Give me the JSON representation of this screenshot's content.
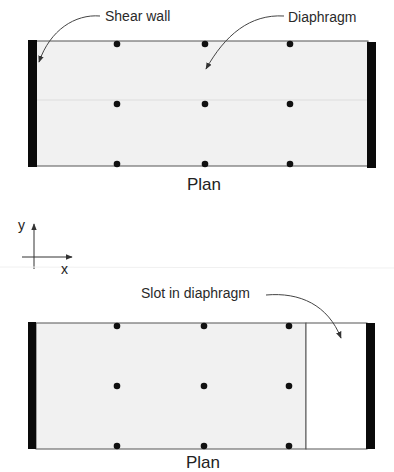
{
  "figure": {
    "top_plan": {
      "caption": "Plan",
      "labels": {
        "shear_wall": "Shear wall",
        "diaphragm": "Diaphragm"
      },
      "columns_grid": {
        "x": [
          117,
          205,
          290
        ],
        "y": [
          44,
          104,
          164
        ]
      }
    },
    "axes": {
      "x_label": "x",
      "y_label": "y"
    },
    "bottom_plan": {
      "caption": "Plan",
      "labels": {
        "slot": "Slot in diaphragm"
      },
      "columns_grid": {
        "x": [
          117,
          204,
          289
        ],
        "y": [
          326,
          386,
          446
        ]
      }
    },
    "colors": {
      "diaphragm_fill": "#f1f1f1",
      "wall": "#0a0a0a",
      "outline": "#444444",
      "slot_fill": "#ffffff"
    }
  }
}
